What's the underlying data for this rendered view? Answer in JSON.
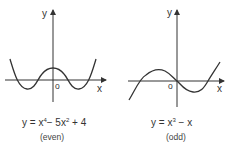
{
  "graphs": [
    {
      "id": "even",
      "y_axis_label": "y",
      "x_axis_label": "x",
      "origin_label": "o",
      "equation": {
        "lhs": "y =",
        "term1": "x",
        "term1_exp": "4",
        "term2": "− 5x",
        "term2_exp": "2",
        "term3": "+ 4"
      },
      "parity_label": "(even)"
    },
    {
      "id": "odd",
      "y_axis_label": "y",
      "x_axis_label": "x",
      "origin_label": "o",
      "equation": {
        "lhs": "y =",
        "term1": "x",
        "term1_exp": "3",
        "term2": "− x"
      },
      "parity_label": "(odd)"
    }
  ]
}
